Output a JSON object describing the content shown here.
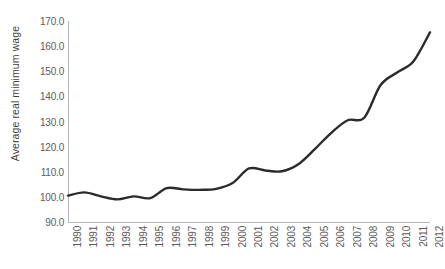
{
  "chart_data": {
    "type": "line",
    "title": "",
    "xlabel": "",
    "ylabel": "Average real minimum wage",
    "ylim": [
      90.0,
      170.0
    ],
    "ytick_step": 10.0,
    "ytick_labels": [
      "170.0",
      "160.0",
      "150.0",
      "140.0",
      "130.0",
      "120.0",
      "110.0",
      "100.0",
      "90.0"
    ],
    "ytick_values": [
      170.0,
      160.0,
      150.0,
      140.0,
      130.0,
      120.0,
      110.0,
      100.0,
      90.0
    ],
    "grid": false,
    "legend": false,
    "legend_position": "none",
    "line_color": "#2b2b2b",
    "axis_color": "#b6b6b6",
    "background_color": "#ffffff",
    "categories": [
      "1990",
      "1991",
      "1992",
      "1993",
      "1994",
      "1995",
      "1996",
      "1997",
      "1998",
      "1999",
      "2000",
      "2001",
      "2002",
      "2003",
      "2004",
      "2005",
      "2006",
      "2007",
      "2008",
      "2009",
      "2010",
      "2011",
      "2012"
    ],
    "x": [
      1990,
      1991,
      1992,
      1993,
      1994,
      1995,
      1996,
      1997,
      1998,
      1999,
      2000,
      2001,
      2002,
      2003,
      2004,
      2005,
      2006,
      2007,
      2008,
      2009,
      2010,
      2011,
      2012
    ],
    "values": [
      100.5,
      101.8,
      100.2,
      99.0,
      100.2,
      99.5,
      103.5,
      103.0,
      102.8,
      103.2,
      105.5,
      111.3,
      110.5,
      110.2,
      113.0,
      119.0,
      125.5,
      130.5,
      131.5,
      144.5,
      149.5,
      154.0,
      165.5
    ],
    "series": [
      {
        "name": "Average real minimum wage",
        "values": [
          100.5,
          101.8,
          100.2,
          99.0,
          100.2,
          99.5,
          103.5,
          103.0,
          102.8,
          103.2,
          105.5,
          111.3,
          110.5,
          110.2,
          113.0,
          119.0,
          125.5,
          130.5,
          131.5,
          144.5,
          149.5,
          154.0,
          165.5
        ]
      }
    ],
    "annotations": []
  }
}
